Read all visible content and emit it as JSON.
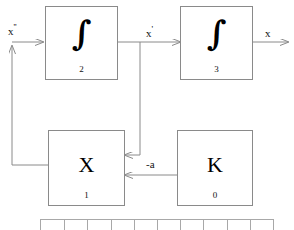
{
  "diagram": {
    "line_color": "#8a8a8a",
    "text_color": "#111111",
    "blocks": [
      {
        "id": "block-2",
        "symbol": "∫",
        "kind": "integral",
        "number": "2"
      },
      {
        "id": "block-3",
        "symbol": "∫",
        "kind": "integral",
        "number": "3"
      },
      {
        "id": "block-1",
        "symbol": "X",
        "kind": "letter",
        "number": "1"
      },
      {
        "id": "block-0",
        "symbol": "K",
        "kind": "letter",
        "number": "0"
      }
    ],
    "signals": {
      "input": {
        "base": "x",
        "prime": "''",
        "full": "x''"
      },
      "mid": {
        "base": "x",
        "prime": "'",
        "full": "x'"
      },
      "output": {
        "base": "x",
        "prime": "",
        "full": "x"
      },
      "gain": {
        "full": "-a"
      }
    },
    "ruler": {
      "tick_count": 9,
      "visible": true
    }
  }
}
